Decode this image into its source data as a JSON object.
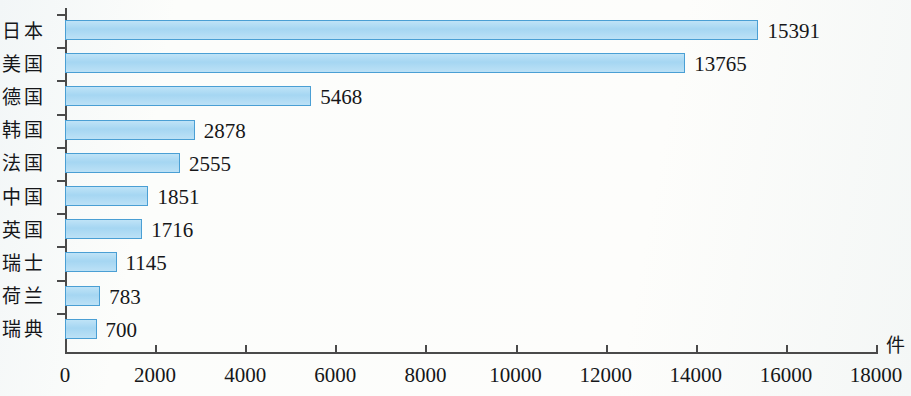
{
  "chart_data": {
    "type": "bar",
    "orientation": "horizontal",
    "title": "",
    "xlabel": "",
    "ylabel": "",
    "unit_label": "件",
    "categories": [
      "日本",
      "美国",
      "德国",
      "韩国",
      "法国",
      "中国",
      "英国",
      "瑞士",
      "荷兰",
      "瑞典"
    ],
    "values": [
      15391,
      13765,
      5468,
      2878,
      2555,
      1851,
      1716,
      1145,
      783,
      700
    ],
    "value_labels": [
      "15391",
      "13765",
      "5468",
      "2878",
      "2555",
      "1851",
      "1716",
      "1145",
      "783",
      "700"
    ],
    "xlim": [
      0,
      18000
    ],
    "xticks": [
      0,
      2000,
      4000,
      6000,
      8000,
      10000,
      12000,
      14000,
      16000,
      18000
    ],
    "xtick_labels": [
      "0",
      "2000",
      "4000",
      "6000",
      "8000",
      "10000",
      "12000",
      "14000",
      "16000",
      "18000"
    ],
    "grid": false,
    "legend": false,
    "bar_fill_color": "#a5d6f2",
    "bar_border_color": "#4a9fd4",
    "axis_color": "#4a4a4a",
    "text_color": "#161719",
    "background_color": "#fbfcfa"
  }
}
